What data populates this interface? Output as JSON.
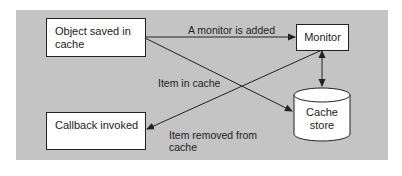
{
  "diagram": {
    "nodes": {
      "object_saved": {
        "label": "Object saved in cache",
        "line1": "Object saved in",
        "line2": "cache"
      },
      "monitor": {
        "label": "Monitor"
      },
      "callback": {
        "label": "Callback invoked"
      },
      "cache_store": {
        "label": "Cache store",
        "line1": "Cache",
        "line2": "store"
      }
    },
    "edges": [
      {
        "from": "object_saved",
        "to": "monitor",
        "label": "A monitor is added"
      },
      {
        "from": "object_saved",
        "to": "cache_store",
        "label": "Item in cache"
      },
      {
        "from": "monitor",
        "to": "callback",
        "label": "Item removed from cache",
        "line1": "Item removed from",
        "line2": "cache"
      },
      {
        "from": "monitor",
        "to": "cache_store",
        "label": "",
        "bidirectional": true
      }
    ],
    "colors": {
      "background": "#c4c4c4",
      "node_fill": "#ffffff",
      "stroke": "#222222"
    }
  }
}
